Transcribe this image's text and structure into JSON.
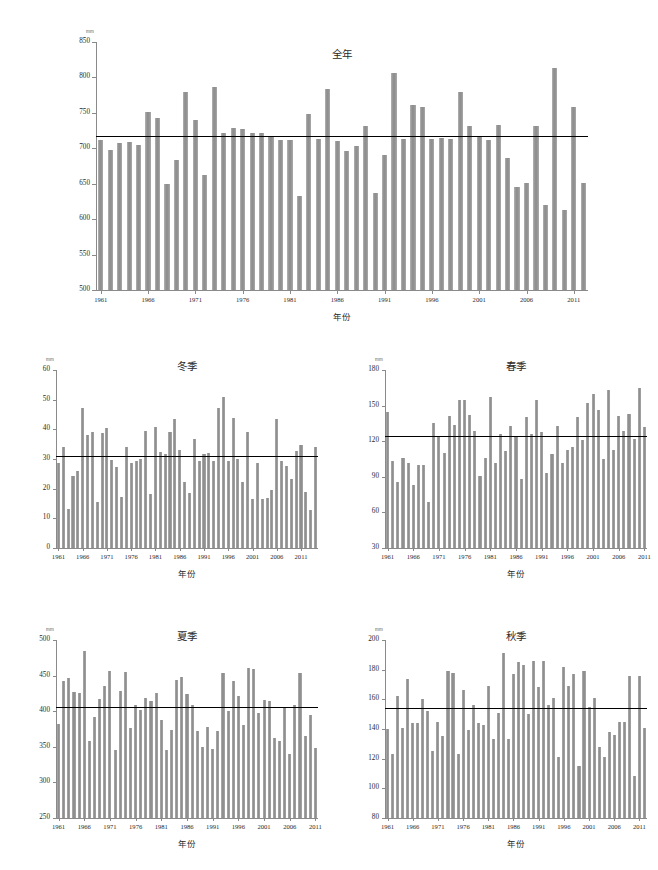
{
  "figure": {
    "unit_label": "mm",
    "xaxis_title": "年份",
    "background": "#ffffff",
    "bar_color": "#9a9a9a",
    "mean_line_color": "#000000",
    "axis_color": "#8a8a8a"
  },
  "chart_data": [
    {
      "id": "annual",
      "type": "bar",
      "title": "全年",
      "xlabel": "年份",
      "ylabel": "mm",
      "ylim": [
        500,
        850
      ],
      "yticks": [
        500,
        550,
        600,
        650,
        700,
        750,
        800,
        850
      ],
      "xticks": [
        1961,
        1966,
        1971,
        1976,
        1981,
        1986,
        1991,
        1996,
        2001,
        2006,
        2011
      ],
      "xlim": [
        1961,
        2012
      ],
      "grid": false,
      "mean": 718,
      "x": [
        1961,
        1962,
        1963,
        1964,
        1965,
        1966,
        1967,
        1968,
        1969,
        1970,
        1971,
        1972,
        1973,
        1974,
        1975,
        1976,
        1977,
        1978,
        1979,
        1980,
        1981,
        1982,
        1983,
        1984,
        1985,
        1986,
        1987,
        1988,
        1989,
        1990,
        1991,
        1992,
        1993,
        1994,
        1995,
        1996,
        1997,
        1998,
        1999,
        2000,
        2001,
        2002,
        2003,
        2004,
        2005,
        2006,
        2007,
        2008,
        2009,
        2010,
        2011,
        2012
      ],
      "values": [
        712,
        697,
        707,
        709,
        705,
        751,
        743,
        650,
        683,
        779,
        740,
        663,
        787,
        722,
        729,
        727,
        721,
        721,
        718,
        712,
        712,
        633,
        748,
        713,
        784,
        711,
        696,
        703,
        731,
        637,
        691,
        806,
        713,
        761,
        758,
        713,
        714,
        713,
        779,
        731,
        716,
        712,
        733,
        686,
        645,
        651,
        731,
        620,
        814,
        613,
        758,
        651
      ]
    },
    {
      "id": "winter",
      "type": "bar",
      "title": "冬季",
      "xlabel": "年份",
      "ylabel": "mm",
      "ylim": [
        0,
        60
      ],
      "yticks": [
        0,
        10,
        20,
        30,
        40,
        50,
        60
      ],
      "xticks": [
        1961,
        1966,
        1971,
        1976,
        1981,
        1986,
        1991,
        1996,
        2001,
        2006,
        2011
      ],
      "xlim": [
        1961,
        2012
      ],
      "grid": false,
      "mean": 31,
      "x": [
        1961,
        1962,
        1963,
        1964,
        1965,
        1966,
        1967,
        1968,
        1969,
        1970,
        1971,
        1972,
        1973,
        1974,
        1975,
        1976,
        1977,
        1978,
        1979,
        1980,
        1981,
        1982,
        1983,
        1984,
        1985,
        1986,
        1987,
        1988,
        1989,
        1990,
        1991,
        1992,
        1993,
        1994,
        1995,
        1996,
        1997,
        1998,
        1999,
        2000,
        2001,
        2002,
        2003,
        2004,
        2005,
        2006,
        2007,
        2008,
        2009,
        2010,
        2011,
        2012
      ],
      "values": [
        28.5,
        34.0,
        13.3,
        24.3,
        26.1,
        47.2,
        38.1,
        39.2,
        15.5,
        38.9,
        40.6,
        29.7,
        27.2,
        17.1,
        34.1,
        28.7,
        29.2,
        30.0,
        39.4,
        18.2,
        40.8,
        32.2,
        31.6,
        39.1,
        43.4,
        32.9,
        22.1,
        18.4,
        36.7,
        29.3,
        31.8,
        31.9,
        29.3,
        47.3,
        50.8,
        29.4,
        43.8,
        30.1,
        22.1,
        39.1,
        16.4,
        28.6,
        16.5,
        16.8,
        19.4,
        43.4,
        29.2,
        27.8,
        23.3,
        32.7,
        34.6,
        18.9,
        12.7,
        34.1
      ]
    },
    {
      "id": "spring",
      "type": "bar",
      "title": "春季",
      "xlabel": "年份",
      "ylabel": "mm",
      "ylim": [
        30,
        180
      ],
      "yticks": [
        30,
        60,
        90,
        120,
        150,
        180
      ],
      "xticks": [
        1961,
        1966,
        1971,
        1976,
        1981,
        1986,
        1991,
        1996,
        2001,
        2006,
        2011
      ],
      "xlim": [
        1961,
        2012
      ],
      "grid": false,
      "mean": 124,
      "x": [
        1961,
        1962,
        1963,
        1964,
        1965,
        1966,
        1967,
        1968,
        1969,
        1970,
        1971,
        1972,
        1973,
        1974,
        1975,
        1976,
        1977,
        1978,
        1979,
        1980,
        1981,
        1982,
        1983,
        1984,
        1985,
        1986,
        1987,
        1988,
        1989,
        1990,
        1991,
        1992,
        1993,
        1994,
        1995,
        1996,
        1997,
        1998,
        1999,
        2000,
        2001,
        2002,
        2003,
        2004,
        2005,
        2006,
        2007,
        2008,
        2009,
        2010,
        2011,
        2012
      ],
      "values": [
        145,
        103,
        86,
        106,
        102,
        83,
        100,
        100,
        69,
        135,
        124,
        110,
        141,
        134,
        155,
        155,
        142,
        129,
        91,
        106,
        157,
        102,
        126,
        112,
        133,
        124,
        88,
        140,
        126,
        155,
        128,
        93,
        109,
        133,
        102,
        113,
        115,
        140,
        121,
        152,
        160,
        146,
        105,
        163,
        113,
        141,
        129,
        143,
        122,
        165,
        132
      ]
    },
    {
      "id": "summer",
      "type": "bar",
      "title": "夏季",
      "xlabel": "年份",
      "ylabel": "mm",
      "ylim": [
        250,
        500
      ],
      "yticks": [
        250,
        300,
        350,
        400,
        450,
        500
      ],
      "xticks": [
        1961,
        1966,
        1971,
        1976,
        1981,
        1986,
        1991,
        1996,
        2001,
        2006,
        2011
      ],
      "xlim": [
        1961,
        2012
      ],
      "grid": false,
      "mean": 406,
      "x": [
        1961,
        1962,
        1963,
        1964,
        1965,
        1966,
        1967,
        1968,
        1969,
        1970,
        1971,
        1972,
        1973,
        1974,
        1975,
        1976,
        1977,
        1978,
        1979,
        1980,
        1981,
        1982,
        1983,
        1984,
        1985,
        1986,
        1987,
        1988,
        1989,
        1990,
        1991,
        1992,
        1993,
        1994,
        1995,
        1996,
        1997,
        1998,
        1999,
        2000,
        2001,
        2002,
        2003,
        2004,
        2005,
        2006,
        2007,
        2008,
        2009,
        2010,
        2011,
        2012
      ],
      "values": [
        382,
        443,
        447,
        427,
        426,
        485,
        358,
        392,
        417,
        436,
        457,
        345,
        429,
        455,
        376,
        409,
        402,
        418,
        415,
        426,
        388,
        346,
        374,
        444,
        448,
        424,
        409,
        372,
        350,
        378,
        347,
        372,
        454,
        400,
        442,
        422,
        381,
        460,
        459,
        397,
        416,
        414,
        362,
        358,
        406,
        340,
        409,
        454,
        365,
        394,
        349
      ]
    },
    {
      "id": "autumn",
      "type": "bar",
      "title": "秋季",
      "xlabel": "年份",
      "ylabel": "mm",
      "ylim": [
        80,
        200
      ],
      "yticks": [
        80,
        100,
        120,
        140,
        160,
        180,
        200
      ],
      "xticks": [
        1961,
        1966,
        1971,
        1976,
        1981,
        1986,
        1991,
        1996,
        2001,
        2006,
        2011
      ],
      "xlim": [
        1961,
        2012
      ],
      "grid": false,
      "mean": 154,
      "x": [
        1961,
        1962,
        1963,
        1964,
        1965,
        1966,
        1967,
        1968,
        1969,
        1970,
        1971,
        1972,
        1973,
        1974,
        1975,
        1976,
        1977,
        1978,
        1979,
        1980,
        1981,
        1982,
        1983,
        1984,
        1985,
        1986,
        1987,
        1988,
        1989,
        1990,
        1991,
        1992,
        1993,
        1994,
        1995,
        1996,
        1997,
        1998,
        1999,
        2000,
        2001,
        2002,
        2003,
        2004,
        2005,
        2006,
        2007,
        2008,
        2009,
        2010,
        2011,
        2012
      ],
      "values": [
        140,
        123,
        162,
        141,
        174,
        144,
        144,
        160,
        152,
        125,
        145,
        135,
        179,
        178,
        123,
        166,
        139,
        156,
        144,
        143,
        169,
        133,
        151,
        191,
        133,
        177,
        185,
        183,
        150,
        186,
        168,
        186,
        156,
        161,
        121,
        182,
        169,
        177,
        115,
        179,
        155,
        161,
        128,
        121,
        138,
        136,
        145,
        145,
        176,
        108,
        176,
        141
      ]
    }
  ]
}
